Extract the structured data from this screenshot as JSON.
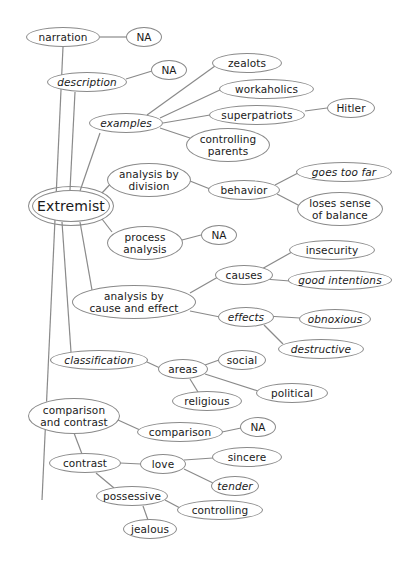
{
  "diagram": {
    "type": "mind-map",
    "title": "Extremist",
    "line_color": "#8a8a8a",
    "nodes": [
      {
        "id": "center",
        "label": "Extremist",
        "x": 32,
        "y": 190,
        "w": 78,
        "h": 32,
        "center": true
      },
      {
        "id": "narration",
        "label": "narration",
        "x": 26,
        "y": 27,
        "w": 74,
        "h": 20
      },
      {
        "id": "narration_na",
        "label": "NA",
        "x": 126,
        "y": 27,
        "w": 36,
        "h": 20
      },
      {
        "id": "description",
        "label": "description",
        "x": 47,
        "y": 72,
        "w": 80,
        "h": 20,
        "italic": true
      },
      {
        "id": "description_na",
        "label": "NA",
        "x": 151,
        "y": 60,
        "w": 36,
        "h": 20
      },
      {
        "id": "examples",
        "label": "examples",
        "x": 89,
        "y": 113,
        "w": 74,
        "h": 20,
        "italic": true
      },
      {
        "id": "zealots",
        "label": "zealots",
        "x": 212,
        "y": 53,
        "w": 70,
        "h": 20
      },
      {
        "id": "workaholics",
        "label": "workaholics",
        "x": 219,
        "y": 79,
        "w": 95,
        "h": 20
      },
      {
        "id": "superpatriots",
        "label": "superpatriots",
        "x": 209,
        "y": 105,
        "w": 96,
        "h": 20
      },
      {
        "id": "hitler",
        "label": "Hitler",
        "x": 327,
        "y": 98,
        "w": 48,
        "h": 20
      },
      {
        "id": "controlling_parents",
        "label": "controlling\nparents",
        "x": 186,
        "y": 128,
        "w": 84,
        "h": 34
      },
      {
        "id": "analysis_division",
        "label": "analysis by\ndivision",
        "x": 107,
        "y": 163,
        "w": 84,
        "h": 34
      },
      {
        "id": "behavior",
        "label": "behavior",
        "x": 208,
        "y": 180,
        "w": 72,
        "h": 20
      },
      {
        "id": "goes_too_far",
        "label": "goes too far",
        "x": 296,
        "y": 162,
        "w": 96,
        "h": 20,
        "italic": true
      },
      {
        "id": "loses_balance",
        "label": "loses sense\nof balance",
        "x": 297,
        "y": 192,
        "w": 86,
        "h": 34
      },
      {
        "id": "process_analysis",
        "label": "process\nanalysis",
        "x": 107,
        "y": 226,
        "w": 76,
        "h": 34
      },
      {
        "id": "process_na",
        "label": "NA",
        "x": 201,
        "y": 225,
        "w": 36,
        "h": 20
      },
      {
        "id": "cause_effect",
        "label": "analysis by\ncause and effect",
        "x": 72,
        "y": 285,
        "w": 124,
        "h": 34
      },
      {
        "id": "causes",
        "label": "causes",
        "x": 215,
        "y": 265,
        "w": 58,
        "h": 20
      },
      {
        "id": "insecurity",
        "label": "insecurity",
        "x": 289,
        "y": 240,
        "w": 86,
        "h": 20
      },
      {
        "id": "good_intentions",
        "label": "good intentions",
        "x": 288,
        "y": 270,
        "w": 104,
        "h": 20,
        "italic": true
      },
      {
        "id": "effects",
        "label": "effects",
        "x": 218,
        "y": 307,
        "w": 56,
        "h": 20,
        "italic": true
      },
      {
        "id": "obnoxious",
        "label": "obnoxious",
        "x": 299,
        "y": 309,
        "w": 72,
        "h": 20,
        "italic": true
      },
      {
        "id": "destructive",
        "label": "destructive",
        "x": 278,
        "y": 339,
        "w": 86,
        "h": 20,
        "italic": true
      },
      {
        "id": "classification",
        "label": "classification",
        "x": 50,
        "y": 350,
        "w": 98,
        "h": 20,
        "italic": true
      },
      {
        "id": "areas",
        "label": "areas",
        "x": 158,
        "y": 359,
        "w": 50,
        "h": 20
      },
      {
        "id": "social",
        "label": "social",
        "x": 218,
        "y": 350,
        "w": 48,
        "h": 20
      },
      {
        "id": "political",
        "label": "political",
        "x": 256,
        "y": 383,
        "w": 72,
        "h": 20
      },
      {
        "id": "religious",
        "label": "religious",
        "x": 172,
        "y": 391,
        "w": 70,
        "h": 20
      },
      {
        "id": "comparison_contrast",
        "label": "comparison\nand contrast",
        "x": 28,
        "y": 398,
        "w": 92,
        "h": 36
      },
      {
        "id": "comparison",
        "label": "comparison",
        "x": 137,
        "y": 422,
        "w": 86,
        "h": 20
      },
      {
        "id": "comparison_na",
        "label": "NA",
        "x": 240,
        "y": 417,
        "w": 36,
        "h": 20
      },
      {
        "id": "contrast",
        "label": "contrast",
        "x": 49,
        "y": 453,
        "w": 72,
        "h": 20
      },
      {
        "id": "love",
        "label": "love",
        "x": 140,
        "y": 454,
        "w": 46,
        "h": 20
      },
      {
        "id": "sincere",
        "label": "sincere",
        "x": 212,
        "y": 447,
        "w": 70,
        "h": 20
      },
      {
        "id": "tender",
        "label": "tender",
        "x": 211,
        "y": 476,
        "w": 48,
        "h": 20,
        "italic": true
      },
      {
        "id": "possessive",
        "label": "possessive",
        "x": 96,
        "y": 486,
        "w": 72,
        "h": 20
      },
      {
        "id": "controlling",
        "label": "controlling",
        "x": 177,
        "y": 500,
        "w": 86,
        "h": 20
      },
      {
        "id": "jealous",
        "label": "jealous",
        "x": 123,
        "y": 519,
        "w": 54,
        "h": 20
      }
    ],
    "edges": [
      {
        "from": [
          63,
          47
        ],
        "to": [
          42,
          500
        ],
        "note": "narration trunk down to comparison and contrast"
      },
      {
        "from": [
          100,
          37
        ],
        "to": [
          126,
          37
        ]
      },
      {
        "from": [
          75,
          92
        ],
        "to": [
          70,
          190
        ],
        "note": "description down to center"
      },
      {
        "from": [
          126,
          79
        ],
        "to": [
          152,
          71
        ]
      },
      {
        "from": [
          100,
          133
        ],
        "to": [
          80,
          191
        ],
        "note": "examples to center"
      },
      {
        "from": [
          147,
          115
        ],
        "to": [
          215,
          66
        ]
      },
      {
        "from": [
          160,
          118
        ],
        "to": [
          222,
          89
        ]
      },
      {
        "from": [
          163,
          123
        ],
        "to": [
          210,
          115
        ]
      },
      {
        "from": [
          305,
          111
        ],
        "to": [
          327,
          108
        ]
      },
      {
        "from": [
          160,
          128
        ],
        "to": [
          190,
          138
        ]
      },
      {
        "from": [
          102,
          193
        ],
        "to": [
          114,
          180
        ]
      },
      {
        "from": [
          190,
          181
        ],
        "to": [
          210,
          189
        ]
      },
      {
        "from": [
          275,
          185
        ],
        "to": [
          298,
          173
        ]
      },
      {
        "from": [
          277,
          194
        ],
        "to": [
          300,
          206
        ]
      },
      {
        "from": [
          102,
          219
        ],
        "to": [
          112,
          232
        ]
      },
      {
        "from": [
          182,
          240
        ],
        "to": [
          201,
          235
        ]
      },
      {
        "from": [
          80,
          222
        ],
        "to": [
          92,
          290
        ],
        "note": "center to cause and effect"
      },
      {
        "from": [
          190,
          293
        ],
        "to": [
          218,
          277
        ]
      },
      {
        "from": [
          190,
          311
        ],
        "to": [
          220,
          317
        ]
      },
      {
        "from": [
          260,
          270
        ],
        "to": [
          292,
          252
        ]
      },
      {
        "from": [
          264,
          279
        ],
        "to": [
          290,
          281
        ]
      },
      {
        "from": [
          266,
          316
        ],
        "to": [
          300,
          318
        ]
      },
      {
        "from": [
          264,
          325
        ],
        "to": [
          283,
          344
        ]
      },
      {
        "from": [
          62,
          222
        ],
        "to": [
          71,
          352
        ],
        "note": "center to classification"
      },
      {
        "from": [
          147,
          362
        ],
        "to": [
          160,
          368
        ]
      },
      {
        "from": [
          205,
          365
        ],
        "to": [
          219,
          360
        ]
      },
      {
        "from": [
          205,
          374
        ],
        "to": [
          258,
          391
        ]
      },
      {
        "from": [
          190,
          379
        ],
        "to": [
          198,
          392
        ]
      },
      {
        "from": [
          118,
          420
        ],
        "to": [
          140,
          430
        ]
      },
      {
        "from": [
          222,
          432
        ],
        "to": [
          241,
          428
        ]
      },
      {
        "from": [
          74,
          433
        ],
        "to": [
          82,
          454
        ]
      },
      {
        "from": [
          120,
          463
        ],
        "to": [
          141,
          464
        ]
      },
      {
        "from": [
          184,
          460
        ],
        "to": [
          213,
          458
        ]
      },
      {
        "from": [
          184,
          469
        ],
        "to": [
          213,
          483
        ]
      },
      {
        "from": [
          96,
          473
        ],
        "to": [
          114,
          488
        ]
      },
      {
        "from": [
          165,
          500
        ],
        "to": [
          180,
          508
        ]
      },
      {
        "from": [
          143,
          506
        ],
        "to": [
          148,
          520
        ]
      }
    ]
  }
}
